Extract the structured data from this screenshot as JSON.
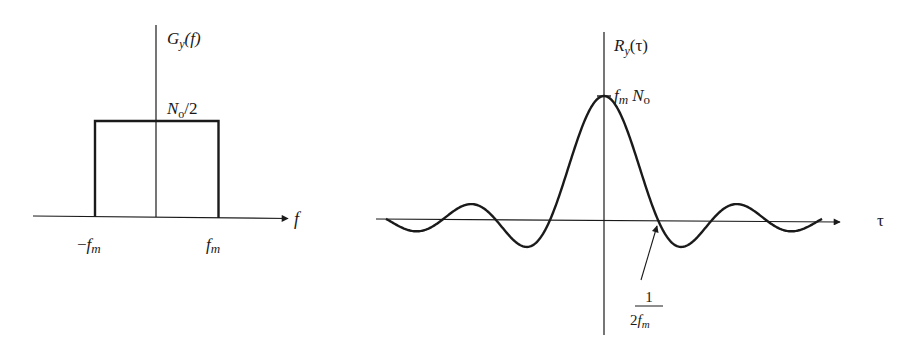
{
  "chart_data": [
    {
      "type": "line",
      "title": "Power spectral density (ideal lowpass band-limited white noise)",
      "ylabel": "G_y(f)",
      "xlabel": "f",
      "shape": "rectangle",
      "x": [
        "-f_m",
        "-f_m",
        "f_m",
        "f_m"
      ],
      "values": [
        "0",
        "N_o/2",
        "N_o/2",
        "0"
      ],
      "tick_labels": {
        "left": "-f_m",
        "right": "f_m",
        "level": "N_o/2"
      },
      "grid": false
    },
    {
      "type": "line",
      "title": "Autocorrelation",
      "ylabel": "R_y(τ)",
      "xlabel": "τ",
      "function": "f_m N_o sinc(2 f_m τ)",
      "peak_value_label": "f_m N_o",
      "first_zero_label": "1/(2f_m)",
      "x_in_units_of_first_zero": [
        -6,
        -5,
        -4,
        -3,
        -2,
        -1,
        0,
        1,
        2,
        3,
        4,
        5,
        6
      ],
      "grid": false
    }
  ],
  "left_plot": {
    "y_axis_label": {
      "main": "G",
      "sub": "y",
      "arg": "(f)"
    },
    "level_label": {
      "main": "N",
      "sub": "o",
      "rest": "/2"
    },
    "x_axis_label": "f",
    "neg_tick": {
      "prefix": "−",
      "main": "f",
      "sub": "m"
    },
    "pos_tick": {
      "main": "f",
      "sub": "m"
    }
  },
  "right_plot": {
    "y_axis_label": {
      "main": "R",
      "sub": "y",
      "arg": "(τ)"
    },
    "peak_label": {
      "f": "f",
      "fsub": "m",
      "n": "N",
      "nsub": "o"
    },
    "x_axis_label": "τ",
    "zero_label": {
      "numerator": "1",
      "denominator_pre": "2",
      "denominator_f": "f",
      "denominator_sub": "m"
    }
  },
  "colors": {
    "ink": "#1a1a1a",
    "background": "#ffffff"
  }
}
